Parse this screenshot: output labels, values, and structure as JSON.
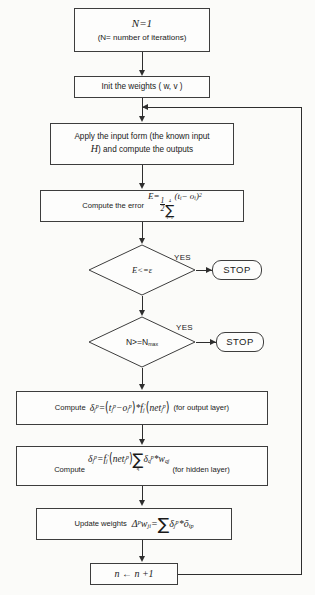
{
  "diagram": {
    "colors": {
      "background": "#fbfbf9",
      "node_fill": "#fdfdfc",
      "stroke": "#3d3d3d",
      "connector": "#2e2e2e",
      "text": "#1a1a1a"
    }
  },
  "nodes": {
    "init_counter": {
      "line1": "N=1",
      "line2": "(N= number of iterations)"
    },
    "init_weights": {
      "text": "Init the weights ( w, v )"
    },
    "apply_input": {
      "line1": "Apply the input form (the known input",
      "line2_var": "H",
      "line2_rest": ") and compute the outputs"
    },
    "compute_error": {
      "lead": "Compute the error",
      "formula_lhs": "E",
      "formula_eq": "=",
      "frac_num": "1",
      "frac_den": "2",
      "sum_upper": "4",
      "sum_lower": "i=1",
      "term": "(t",
      "term_sub1": "i",
      "term_minus": "− o",
      "term_sub2": "i",
      "term_close": ")",
      "term_pow": "2"
    },
    "decision_error": {
      "label": "E<=ε",
      "yes_label": "YES"
    },
    "stop_error": {
      "label": "STOP"
    },
    "decision_iterations": {
      "label_prefix": "N>=N",
      "label_sub": "max",
      "yes_label": "YES"
    },
    "stop_iterations": {
      "label": "STOP"
    },
    "delta_output": {
      "lead": "Compute",
      "tail": "(for output layer)",
      "delta": "δ",
      "delta_sub": "j",
      "delta_sup": "p",
      "eq": "=",
      "t_sym": "t",
      "t_sub": "j",
      "t_sup": "p",
      "minus": "−",
      "o_sym": "o",
      "o_sub": "j",
      "o_sup": "p",
      "star": "*",
      "f_sym": "f",
      "f_sub": "j",
      "f_prime": "′",
      "net_sym": "net",
      "net_sub": "j",
      "net_sup": "p"
    },
    "delta_hidden": {
      "lead": "Compute",
      "tail": "(for hidden layer)",
      "delta": "δ",
      "delta_sub": "j",
      "delta_sup": "p",
      "eq": "=",
      "f_sym": "f",
      "f_sub": "j",
      "f_prime": "′",
      "net_sym": "net",
      "net_sub": "j",
      "net_sup": "p",
      "sum_lower": "q",
      "delta2": "δ",
      "delta2_sub": "q",
      "delta2_sup": "p",
      "star": "*",
      "w_sym": "w",
      "w_sub": "qj"
    },
    "update_weights": {
      "lead": "Update weights",
      "delta_cap": "Δ",
      "delta_cap_sup": "p",
      "w_sym": "w",
      "w_sub": "ji",
      "eq": "=",
      "delta": "δ",
      "delta_sub": "j",
      "delta_sup": "p",
      "star": "*",
      "o_sym": "õ",
      "o_sub": "ip"
    },
    "increment": {
      "text": "n ← n +1"
    }
  },
  "edges": {
    "yes_error": "YES",
    "yes_iterations": "YES",
    "feedback": "loop back to apply-input"
  }
}
